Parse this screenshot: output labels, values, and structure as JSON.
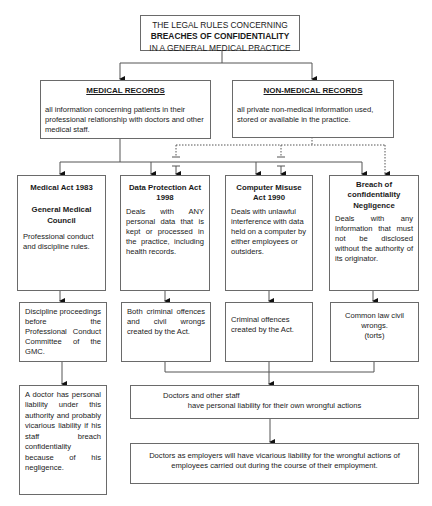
{
  "title": {
    "line1": "THE LEGAL RULES CONCERNING",
    "line2": "BREACHES OF CONFIDENTIALITY",
    "line3": "IN A GENERAL MEDICAL PRACTICE"
  },
  "categories": [
    {
      "heading": "MEDICAL RECORDS",
      "description": "all information concerning patients in their professional relationship with doctors and other medical staff."
    },
    {
      "heading": "NON-MEDICAL RECORDS",
      "description": "all private non-medical information used, stored or available in the practice."
    }
  ],
  "laws": [
    {
      "title": "Medical Act 1983",
      "subtitle": "General Medical Council",
      "description": "Professional conduct and discipline rules.",
      "consequence": "Discipline proceedings before the Professional Conduct Committee of the GMC."
    },
    {
      "title": "Data Protection Act 1998",
      "description": "Deals with ANY personal data that is kept or processed in the practice, including health records.",
      "consequence": "Both criminal offences and civil wrongs created by the Act."
    },
    {
      "title": "Computer Misuse Act 1990",
      "description": "Deals with unlawful interference with data held on a computer by either employees or outsiders.",
      "consequence": "Criminal offences created by the Act."
    },
    {
      "title": "Breach of confidentiality Negligence",
      "description": "Deals with any information that must not be disclosed without the authority of its originator.",
      "consequence_line1": "Common law civil wrongs.",
      "consequence_line2": "(torts)"
    }
  ],
  "gmc_liability": "A doctor has personal liability under this authority and probably vicarious liability if his staff breach confidentiality because of his negligence.",
  "personal_liability": {
    "line1": "Doctors and other staff",
    "line2": "have personal liability for their own wrongful actions"
  },
  "vicarious_liability": {
    "line1": "Doctors as employers will have vicarious liability for the wrongful actions of",
    "line2": "employees carried out during the course of their employment."
  },
  "colors": {
    "border": "#6a6a6a",
    "line": "#555555",
    "text": "#1a1a1a",
    "background": "#ffffff"
  }
}
